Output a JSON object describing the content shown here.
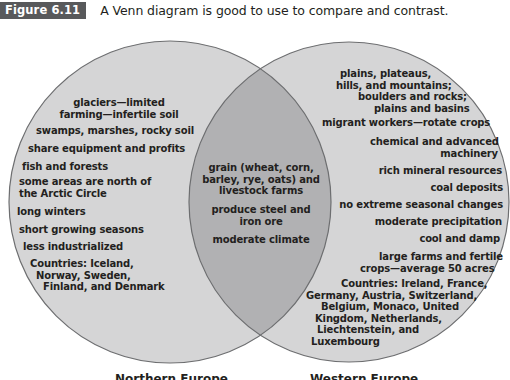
{
  "caption": {
    "figure_label": "Figure 6.11",
    "text": "A Venn diagram is good to use to compare and contrast."
  },
  "colors": {
    "circle_fill": "#d5d5d6",
    "overlap_fill": "#b1b1b3",
    "outline": "#6d6e70",
    "figure_label_bg": "#58595b"
  },
  "venn": {
    "left": {
      "title": "Northern Europe",
      "items": [
        "glaciers—limited",
        "farming—infertile soil",
        "swamps, marshes, rocky soil",
        "share equipment and profits",
        "fish and forests",
        "some areas are north of",
        "the Arctic Circle",
        "long winters",
        "short growing seasons",
        "less industrialized",
        "Countries: Iceland,",
        "Norway, Sweden,",
        "Finland, and Denmark"
      ]
    },
    "overlap": {
      "items": [
        "grain (wheat, corn,",
        "barley, rye, oats) and",
        "livestock farms",
        "produce steel and",
        "iron ore",
        "moderate climate"
      ]
    },
    "right": {
      "title": "Western Europe",
      "items": [
        "plains, plateaus,",
        "hills, and mountains;",
        "boulders and rocks;",
        "plains and basins",
        "migrant workers—rotate crops",
        "chemical and advanced",
        "machinery",
        "rich mineral resources",
        "coal deposits",
        "no extreme seasonal changes",
        "moderate precipitation",
        "cool and damp",
        "large farms and fertile",
        "crops—average 50 acres",
        "Countries: Ireland, France,",
        "Germany, Austria, Switzerland,",
        "Belgium, Monaco, United",
        "Kingdom, Netherlands,",
        "Liechtenstein, and",
        "Luxembourg"
      ]
    }
  }
}
